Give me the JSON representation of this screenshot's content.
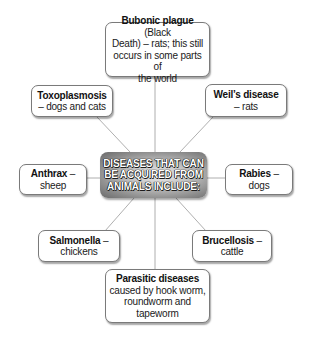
{
  "center": {
    "lines": [
      "DISEASES THAT CAN",
      "BE ACQUIRED FROM",
      "ANIMALS INCLUDE:"
    ]
  },
  "nodes": {
    "bubonic": {
      "name": "Bubonic plague",
      "rest_line1": " (Black",
      "lines": [
        "Death) – rats; this still",
        "occurs in some parts of",
        "the world"
      ]
    },
    "toxoplasmosis": {
      "name": "Toxoplasmosis",
      "lines": [
        "– dogs and cats"
      ]
    },
    "weils": {
      "name": "Weil’s disease",
      "lines": [
        "– rats"
      ]
    },
    "anthrax": {
      "name": "Anthrax",
      "suffix": " –",
      "lines": [
        "sheep"
      ]
    },
    "rabies": {
      "name": "Rabies",
      "suffix": " –",
      "lines": [
        "dogs"
      ]
    },
    "salmonella": {
      "name": "Salmonella",
      "suffix": " –",
      "lines": [
        "chickens"
      ]
    },
    "brucellosis": {
      "name": "Brucellosis",
      "suffix": " –",
      "lines": [
        "cattle"
      ]
    },
    "parasitic": {
      "name": "Parasitic diseases",
      "lines": [
        "caused by hook worm,",
        "roundworm and",
        "tapeworm"
      ]
    }
  },
  "colors": {
    "connector": "#9a9a9a",
    "border": "#7a7a7a",
    "center_dark": "#6a6a6a",
    "center_light": "#eeeeee"
  }
}
